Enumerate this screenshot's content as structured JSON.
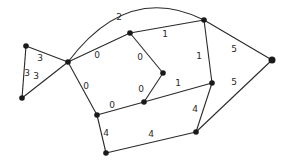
{
  "diagram": {
    "type": "weighted-graph",
    "nodes": [
      {
        "id": "A",
        "x": 26,
        "y": 46
      },
      {
        "id": "B",
        "x": 22,
        "y": 98
      },
      {
        "id": "C",
        "x": 68,
        "y": 62
      },
      {
        "id": "D",
        "x": 130,
        "y": 33
      },
      {
        "id": "E",
        "x": 204,
        "y": 20
      },
      {
        "id": "F",
        "x": 272,
        "y": 60
      },
      {
        "id": "G",
        "x": 163,
        "y": 73
      },
      {
        "id": "H",
        "x": 144,
        "y": 102
      },
      {
        "id": "I",
        "x": 212,
        "y": 83
      },
      {
        "id": "J",
        "x": 97,
        "y": 115
      },
      {
        "id": "K",
        "x": 196,
        "y": 132
      },
      {
        "id": "L",
        "x": 106,
        "y": 153
      }
    ],
    "edges": [
      {
        "from": "A",
        "to": "C",
        "weight": "3",
        "lx": 40,
        "ly": 61
      },
      {
        "from": "A",
        "to": "B",
        "weight": "3",
        "lx": 27,
        "ly": 76
      },
      {
        "from": "B",
        "to": "C",
        "weight": "3",
        "lx": 36,
        "ly": 79
      },
      {
        "from": "C",
        "to": "E",
        "weight": "2",
        "curved": true,
        "lx": 119,
        "ly": 20
      },
      {
        "from": "C",
        "to": "D",
        "weight": "0",
        "lx": 97,
        "ly": 58
      },
      {
        "from": "D",
        "to": "E",
        "weight": "1",
        "lx": 165,
        "ly": 37
      },
      {
        "from": "D",
        "to": "G",
        "weight": "0",
        "lx": 140,
        "ly": 60
      },
      {
        "from": "G",
        "to": "H",
        "weight": "0",
        "lx": 141,
        "ly": 92
      },
      {
        "from": "C",
        "to": "J",
        "weight": "0",
        "lx": 86,
        "ly": 89
      },
      {
        "from": "J",
        "to": "H",
        "weight": "0",
        "lx": 112,
        "ly": 108
      },
      {
        "from": "H",
        "to": "I",
        "weight": "1",
        "lx": 178,
        "ly": 86
      },
      {
        "from": "E",
        "to": "I",
        "weight": "1",
        "lx": 199,
        "ly": 59
      },
      {
        "from": "E",
        "to": "F",
        "weight": "5",
        "lx": 234,
        "ly": 52
      },
      {
        "from": "I",
        "to": "K",
        "weight": "4",
        "lx": 195,
        "ly": 112
      },
      {
        "from": "K",
        "to": "F",
        "weight": "5",
        "lx": 234,
        "ly": 85
      },
      {
        "from": "J",
        "to": "L",
        "weight": "4",
        "lx": 106,
        "ly": 136
      },
      {
        "from": "L",
        "to": "K",
        "weight": "4",
        "lx": 151,
        "ly": 137
      }
    ]
  }
}
